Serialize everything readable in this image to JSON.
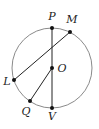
{
  "diagram": {
    "type": "circle-geometry",
    "circle": {
      "center": "O",
      "cx": 52,
      "cy": 68,
      "r": 40,
      "stroke": "#8a8a8a"
    },
    "points": {
      "P": {
        "label": "P",
        "x": 52,
        "y": 28,
        "lx": 52,
        "ly": 20
      },
      "M": {
        "label": "M",
        "x": 70,
        "y": 32,
        "lx": 72,
        "ly": 23
      },
      "L": {
        "label": "L",
        "x": 14,
        "y": 80,
        "lx": 7,
        "ly": 85
      },
      "O": {
        "label": "O",
        "x": 52,
        "y": 68,
        "lx": 62,
        "ly": 72
      },
      "Q": {
        "label": "Q",
        "x": 30,
        "y": 101,
        "lx": 26,
        "ly": 115
      },
      "V": {
        "label": "V",
        "x": 52,
        "y": 108,
        "lx": 52,
        "ly": 120
      }
    },
    "segments": [
      {
        "name": "PV",
        "from": "P",
        "to": "V"
      },
      {
        "name": "LM",
        "from": "L",
        "to": "M"
      },
      {
        "name": "OQ",
        "from": "O",
        "to": "Q"
      }
    ],
    "line_color": "#222222",
    "dot_color": "#111111"
  }
}
